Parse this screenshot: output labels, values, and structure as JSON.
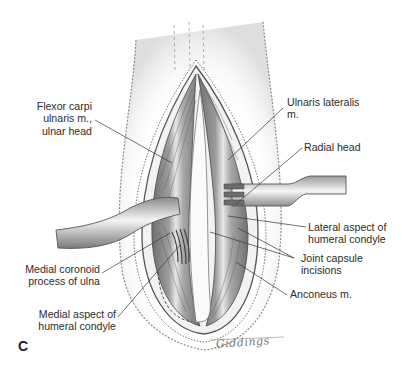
{
  "figure": {
    "panel_letter": "C",
    "signature": "Giddings",
    "labels": {
      "flexor_carpi": "Flexor carpi\nulnaris m.,\nulnar head",
      "ulnaris_lateralis": "Ulnaris lateralis\nm.",
      "radial_head": "Radial head",
      "lateral_aspect": "Lateral aspect of\nhumeral condyle",
      "joint_capsule": "Joint capsule\nincisions",
      "anconeus": "Anconeus m.",
      "medial_coronoid": "Medial coronoid\nprocess of ulna",
      "medial_aspect": "Medial aspect of\nhumeral condyle"
    },
    "colors": {
      "ink": "#2b2b2b",
      "shade_dark": "#5a5a5a",
      "shade_mid": "#9a9a9a",
      "shade_light": "#d8d8d8",
      "background": "#ffffff"
    }
  }
}
